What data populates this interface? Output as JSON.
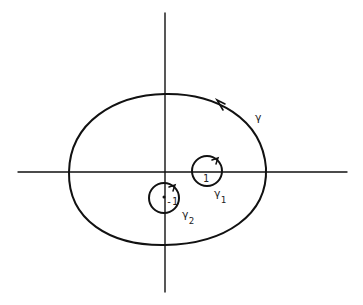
{
  "diagram": {
    "colors": {
      "ink": "#111111",
      "background": "#ffffff"
    },
    "axes": {
      "horizontal": {
        "x1": 18,
        "x2": 347,
        "y": 172
      },
      "vertical": {
        "x": 165,
        "y1": 13,
        "y2": 292
      }
    },
    "contours": [
      {
        "id": "gamma",
        "label": "γ",
        "subscript": "",
        "label_x": 255,
        "label_y": 121,
        "orientation": "counterclockwise"
      },
      {
        "id": "gamma1",
        "label": "γ",
        "subscript": "1",
        "center": [
          207,
          171
        ],
        "radius": 15,
        "point_label": "1",
        "label_x": 214,
        "label_y": 197,
        "orientation": "counterclockwise"
      },
      {
        "id": "gamma2",
        "label": "γ",
        "subscript": "2",
        "center": [
          164,
          198
        ],
        "radius": 15,
        "point_label": "-1",
        "label_x": 182,
        "label_y": 218,
        "orientation": "counterclockwise"
      }
    ]
  }
}
